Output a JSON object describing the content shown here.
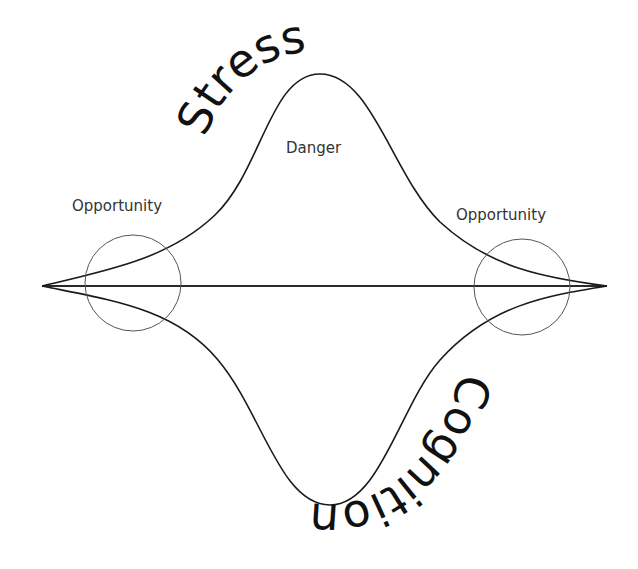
{
  "diagram": {
    "top_arc_word": "Stress",
    "bottom_arc_word": "Cognition",
    "peak_label": "Danger",
    "left_label": "Opportunity",
    "right_label": "Opportunity",
    "colors": {
      "stroke": "#1a1a1a",
      "circle": "#555555",
      "text": "#111111",
      "label": "#333333",
      "background": "#ffffff"
    }
  }
}
